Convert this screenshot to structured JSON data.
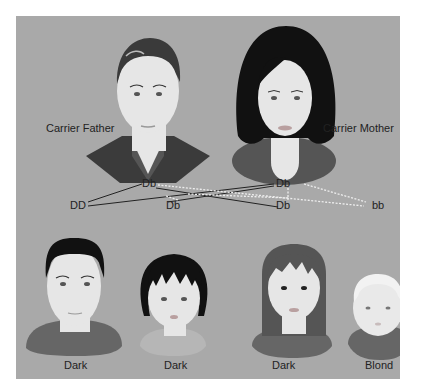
{
  "parents": {
    "father": {
      "label": "Carrier Father",
      "genotype": "Db"
    },
    "mother": {
      "label": "Carrier Mother",
      "genotype": "Db"
    }
  },
  "offspring_genotypes": [
    "DD",
    "Db",
    "Db",
    "bb"
  ],
  "children": [
    {
      "label": "Dark",
      "genotype": "DD"
    },
    {
      "label": "Dark",
      "genotype": "Db"
    },
    {
      "label": "Dark",
      "genotype": "Db"
    },
    {
      "label": "Blond",
      "genotype": "bb"
    }
  ],
  "colors": {
    "background": "#a9a9a9",
    "skin": "#e6e6e6",
    "dark_hair": "#111111",
    "father_hair": "#3a3a3a",
    "dark_allele_line": "#222222",
    "recessive_allele_line": "#e8e8e8"
  }
}
